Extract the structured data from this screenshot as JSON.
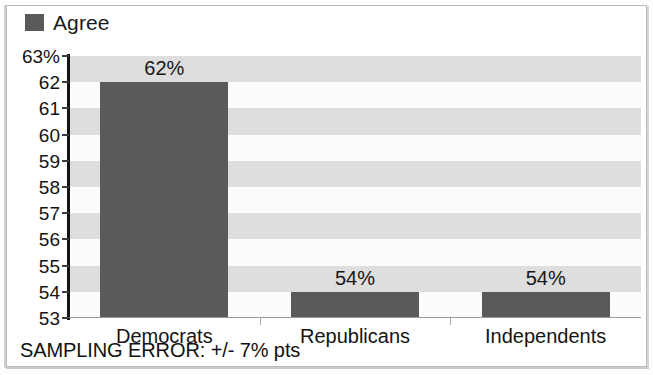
{
  "chart_data": {
    "type": "bar",
    "title": "",
    "subtitle": "",
    "xlabel": "",
    "ylabel": "",
    "categories": [
      "Democrats",
      "Republicans",
      "Independents"
    ],
    "series": [
      {
        "name": "Agree",
        "values": [
          62,
          54,
          54
        ],
        "value_labels": [
          "62%",
          "54%",
          "54%"
        ],
        "color": "#5a5a5c"
      }
    ],
    "ylim": [
      53,
      63
    ],
    "y_ticks": [
      63,
      62,
      61,
      60,
      59,
      58,
      57,
      56,
      55,
      54,
      53
    ],
    "y_tick_labels": [
      "63%",
      "62",
      "61",
      "60",
      "59",
      "58",
      "57",
      "56",
      "55",
      "54",
      "53"
    ],
    "grid": "alternating-horizontal-bands",
    "legend_position": "top-left",
    "annotations": [
      "SAMPLING ERROR: +/- 7% pts"
    ]
  },
  "legend": {
    "entries": [
      {
        "label": "Agree",
        "color": "#5a5a5c"
      }
    ]
  },
  "footnote": {
    "text": "SAMPLING ERROR: +/- 7% pts"
  },
  "colors": {
    "bar": "#5a5a5c",
    "band_shaded": "#dedede",
    "band_plain": "#fcfcfc",
    "axis": "#141414",
    "text": "#141414"
  }
}
